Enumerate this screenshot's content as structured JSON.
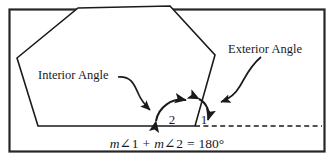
{
  "figure": {
    "frame_color": "#1f1f1f",
    "line_color": "#1a1a1a",
    "background": "#ffffff"
  },
  "labels": {
    "interior": "Interior Angle",
    "exterior": "Exterior Angle",
    "angle_one": "1",
    "angle_two": "2"
  },
  "equation": {
    "m_one": "m",
    "angle_sym_one": "∠",
    "num_one": "1",
    "plus": "+",
    "m_two": "m",
    "angle_sym_two": "∠",
    "num_two": "2",
    "equals": "=",
    "result": "180°",
    "full_text": "m∠1 + m∠2 = 180°"
  },
  "shape": {
    "name": "pentagon",
    "vertices": "17,58 78,8 170,6 215,55 195,126 38,126"
  },
  "extension_ray": {
    "name": "dashed-extension",
    "from_x": 195,
    "from_y": 126,
    "to_x": 322,
    "to_y": 126,
    "style": "dashed"
  }
}
